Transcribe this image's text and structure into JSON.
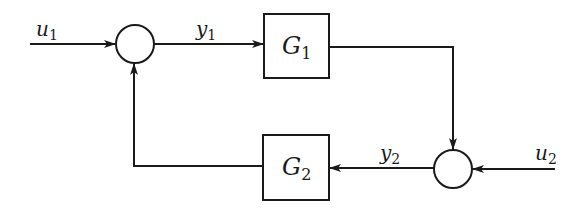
{
  "diagram": {
    "type": "feedback block diagram",
    "signals": {
      "u1": {
        "base": "u",
        "sub": "1"
      },
      "y1": {
        "base": "y",
        "sub": "1"
      },
      "y2": {
        "base": "y",
        "sub": "2"
      },
      "u2": {
        "base": "u",
        "sub": "2"
      }
    },
    "blocks": {
      "G1": {
        "base": "G",
        "sub": "1"
      },
      "G2": {
        "base": "G",
        "sub": "2"
      }
    },
    "summing_junctions": [
      "sum1",
      "sum2"
    ],
    "connections": [
      {
        "from": "u1",
        "to": "sum1"
      },
      {
        "from": "sum1",
        "to": "G1",
        "signal": "y1"
      },
      {
        "from": "G1",
        "to": "sum2"
      },
      {
        "from": "u2",
        "to": "sum2"
      },
      {
        "from": "sum2",
        "to": "G2",
        "signal": "y2"
      },
      {
        "from": "G2",
        "to": "sum1"
      }
    ],
    "colors": {
      "stroke": "#1a1a1a",
      "background": "#ffffff"
    }
  }
}
